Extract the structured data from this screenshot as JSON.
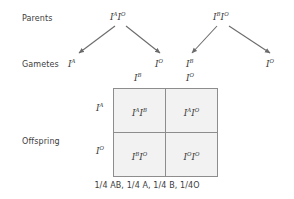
{
  "diagram": {
    "row_labels": {
      "parents": "Parents",
      "gametes": "Gametes",
      "offspring": "Offspring"
    },
    "parents": [
      {
        "name": "parent-1",
        "allele_1": "I",
        "sup_1": "A",
        "allele_2": "I",
        "sup_2": "O",
        "text": "IAIO"
      },
      {
        "name": "parent-2",
        "allele_1": "I",
        "sup_1": "B",
        "allele_2": "I",
        "sup_2": "O",
        "text": "IBIO"
      }
    ],
    "gametes": [
      {
        "allele": "I",
        "sup": "A"
      },
      {
        "allele": "I",
        "sup": "O"
      },
      {
        "allele": "I",
        "sup": "B"
      },
      {
        "allele": "I",
        "sup": "O"
      }
    ],
    "arrows": {
      "count": 4,
      "color": "#6b6b6b",
      "description": "two V-shaped pairs of arrows from each parent down to its two gametes"
    },
    "punnett": {
      "column_headers": [
        {
          "allele": "I",
          "sup": "B"
        },
        {
          "allele": "I",
          "sup": "O"
        }
      ],
      "row_headers": [
        {
          "allele": "I",
          "sup": "A"
        },
        {
          "allele": "I",
          "sup": "O"
        }
      ],
      "cells": [
        [
          {
            "a1": "I",
            "s1": "A",
            "a2": "I",
            "s2": "B"
          },
          {
            "a1": "I",
            "s1": "A",
            "a2": "I",
            "s2": "O"
          }
        ],
        [
          {
            "a1": "I",
            "s1": "B",
            "a2": "I",
            "s2": "O"
          },
          {
            "a1": "I",
            "s1": "O",
            "a2": "I",
            "s2": "O"
          }
        ]
      ],
      "cell_fill": "#f2f2f2",
      "border_color": "#8d8d8d"
    },
    "caption": "1/4 AB, 1/4 A, 1/4 B, 1/4O"
  }
}
